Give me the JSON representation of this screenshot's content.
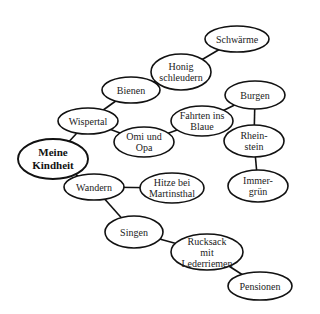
{
  "diagram": {
    "type": "mind-map",
    "root": "n_root",
    "nodes": [
      {
        "id": "n_root",
        "lines": [
          "Meine",
          "Kindheit"
        ],
        "cx": 53,
        "cy": 159,
        "rx": 35,
        "ry": 20,
        "root": true
      },
      {
        "id": "n_wispertal",
        "lines": [
          "Wispertal"
        ],
        "cx": 88,
        "cy": 121,
        "rx": 30,
        "ry": 13
      },
      {
        "id": "n_bienen",
        "lines": [
          "Bienen"
        ],
        "cx": 131,
        "cy": 90,
        "rx": 29,
        "ry": 13
      },
      {
        "id": "n_honig",
        "lines": [
          "Honig",
          "schleudern"
        ],
        "cx": 181,
        "cy": 72,
        "rx": 30,
        "ry": 18
      },
      {
        "id": "n_schwaerme",
        "lines": [
          "Schwärme"
        ],
        "cx": 237,
        "cy": 39,
        "rx": 32,
        "ry": 13
      },
      {
        "id": "n_omi",
        "lines": [
          "Omi und",
          "Opa"
        ],
        "cx": 144,
        "cy": 142,
        "rx": 30,
        "ry": 15
      },
      {
        "id": "n_fahrten",
        "lines": [
          "Fahrten ins",
          "Blaue"
        ],
        "cx": 202,
        "cy": 121,
        "rx": 31,
        "ry": 15
      },
      {
        "id": "n_burgen",
        "lines": [
          "Burgen"
        ],
        "cx": 255,
        "cy": 95,
        "rx": 30,
        "ry": 14
      },
      {
        "id": "n_rheinstein",
        "lines": [
          "Rhein-",
          "stein"
        ],
        "cx": 254,
        "cy": 141,
        "rx": 30,
        "ry": 16
      },
      {
        "id": "n_immergruen",
        "lines": [
          "Immer-",
          "grün"
        ],
        "cx": 258,
        "cy": 186,
        "rx": 30,
        "ry": 16
      },
      {
        "id": "n_wandern",
        "lines": [
          "Wandern"
        ],
        "cx": 94,
        "cy": 187,
        "rx": 30,
        "ry": 13
      },
      {
        "id": "n_hitze",
        "lines": [
          "Hitze bei",
          "Martinsthal"
        ],
        "cx": 172,
        "cy": 188,
        "rx": 32,
        "ry": 15
      },
      {
        "id": "n_singen",
        "lines": [
          "Singen"
        ],
        "cx": 134,
        "cy": 232,
        "rx": 29,
        "ry": 16
      },
      {
        "id": "n_rucksack",
        "lines": [
          "Rucksack",
          "mit",
          "Lederriemen"
        ],
        "cx": 207,
        "cy": 252,
        "rx": 36,
        "ry": 18
      },
      {
        "id": "n_pensionen",
        "lines": [
          "Pensionen"
        ],
        "cx": 260,
        "cy": 286,
        "rx": 32,
        "ry": 14
      }
    ],
    "edges": [
      {
        "from": "n_root",
        "to": "n_wispertal"
      },
      {
        "from": "n_wispertal",
        "to": "n_bienen"
      },
      {
        "from": "n_bienen",
        "to": "n_honig"
      },
      {
        "from": "n_honig",
        "to": "n_schwaerme"
      },
      {
        "from": "n_wispertal",
        "to": "n_omi"
      },
      {
        "from": "n_omi",
        "to": "n_fahrten"
      },
      {
        "from": "n_fahrten",
        "to": "n_burgen"
      },
      {
        "from": "n_burgen",
        "to": "n_rheinstein"
      },
      {
        "from": "n_rheinstein",
        "to": "n_immergruen"
      },
      {
        "from": "n_root",
        "to": "n_wandern"
      },
      {
        "from": "n_wandern",
        "to": "n_hitze"
      },
      {
        "from": "n_wandern",
        "to": "n_singen"
      },
      {
        "from": "n_singen",
        "to": "n_rucksack"
      },
      {
        "from": "n_rucksack",
        "to": "n_pensionen"
      }
    ],
    "colors": {
      "stroke": "#111111",
      "fill": "#ffffff",
      "text": "#222222"
    }
  }
}
